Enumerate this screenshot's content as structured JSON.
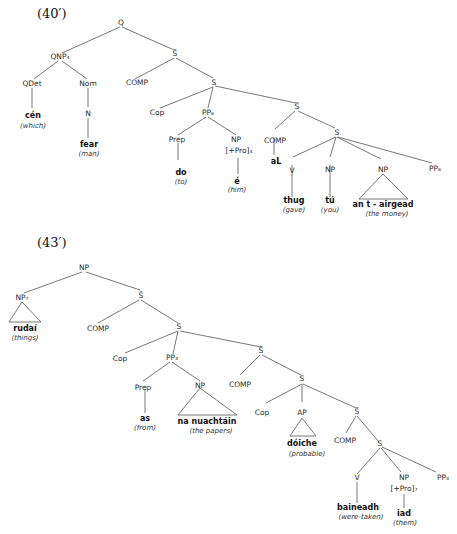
{
  "tree1": {
    "label": "(40′)",
    "nodes": {
      "Q": "Q",
      "QNP": "QNP₄",
      "Sbar1": "S̄",
      "QDet": "QDet",
      "Nom": "Nom",
      "COMP1": "COMP",
      "S1": "S",
      "N": "N",
      "Cop": "Cop",
      "PP6": "PP₆",
      "Sbar2": "S̄",
      "Prep": "Prep",
      "NP1": "NP",
      "Pro": "[+Pro]₄",
      "COMP2": "COMP",
      "S2": "S",
      "V": "V",
      "NP2": "NP",
      "NP3": "NP",
      "PP6b": "PP₆"
    },
    "words": {
      "cen": "cén",
      "cen_gloss": "(which)",
      "fear": "fear",
      "fear_gloss": "(man)",
      "do": "do",
      "do_gloss": "(to)",
      "e": "é",
      "e_gloss": "(him)",
      "aL": "aL",
      "thug": "thug",
      "thug_gloss": "(gave)",
      "tu": "tú",
      "tu_gloss": "(you)",
      "airgead": "an t - airgead",
      "airgead_gloss": "(the money)"
    }
  },
  "tree2": {
    "label": "(43′)",
    "nodes": {
      "NP": "NP",
      "NP7": "NP₇",
      "Sbar1": "S̄",
      "COMP1": "COMP",
      "S1": "S",
      "Cop1": "Cop",
      "PP3": "PP₃",
      "Sbar2": "S̄",
      "Prep": "Prep",
      "NP1": "NP",
      "COMP2": "COMP",
      "S2": "S",
      "Cop2": "Cop",
      "AP": "AP",
      "Sbar3": "S̄",
      "COMP3": "COMP",
      "S3": "S",
      "V": "V",
      "NP2": "NP",
      "Pro": "[+Pro]₇",
      "PP3b": "PP₃"
    },
    "words": {
      "rudai": "rudaí",
      "rudai_gloss": "(things)",
      "as": "as",
      "as_gloss": "(from)",
      "nuachtain": "na nuachtáin",
      "nuachtain_gloss": "(the papers)",
      "doiche": "dóiche",
      "doiche_gloss": "(probable)",
      "baineadh": "baineadh",
      "baineadh_gloss": "(were-taken)",
      "iad": "iad",
      "iad_gloss": "(them)"
    }
  }
}
